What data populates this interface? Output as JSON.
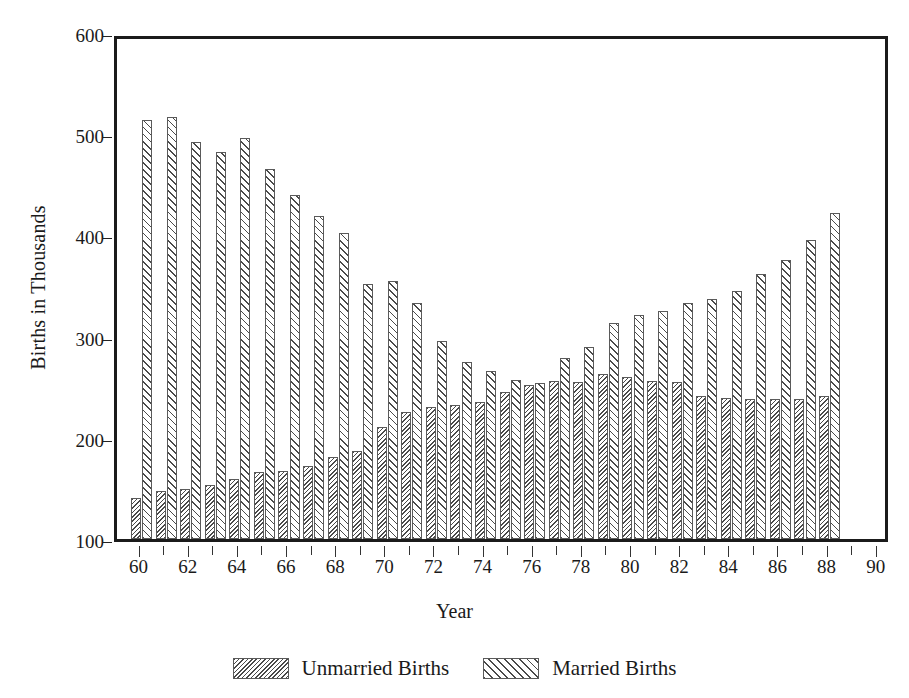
{
  "chart_data": {
    "type": "bar",
    "title": "",
    "xlabel": "Year",
    "ylabel": "Births in Thousands",
    "xlim": [
      59,
      90.5
    ],
    "ylim": [
      100,
      600
    ],
    "ybaseline": 100,
    "yticks": [
      600,
      500,
      400,
      300,
      200,
      100
    ],
    "ytick_labels": [
      "600",
      "500",
      "400",
      "300",
      "200",
      "100"
    ],
    "xticks_major": [
      60,
      62,
      64,
      66,
      68,
      70,
      72,
      74,
      76,
      78,
      80,
      82,
      84,
      86,
      88,
      90
    ],
    "xtick_labels": [
      "60",
      "62",
      "64",
      "66",
      "68",
      "70",
      "72",
      "74",
      "76",
      "78",
      "80",
      "82",
      "84",
      "86",
      "88",
      "90"
    ],
    "xticks_minor": [
      61,
      63,
      65,
      67,
      69,
      71,
      73,
      75,
      77,
      79,
      81,
      83,
      85,
      87,
      89
    ],
    "grid": false,
    "legend_position": "bottom",
    "categories": [
      60,
      61,
      62,
      63,
      64,
      65,
      66,
      67,
      68,
      69,
      70,
      71,
      72,
      73,
      74,
      75,
      76,
      77,
      78,
      79,
      80,
      81,
      82,
      83,
      84,
      85,
      86,
      87,
      88
    ],
    "series": [
      {
        "name": "Unmarried Births",
        "hatch": "dense-backslash",
        "values": [
          141,
          147,
          149,
          153,
          159,
          166,
          167,
          172,
          181,
          187,
          211,
          226,
          230,
          232,
          235,
          245,
          252,
          256,
          255,
          263,
          260,
          256,
          255,
          241,
          239,
          238,
          238,
          238,
          241
        ]
      },
      {
        "name": "Married Births",
        "hatch": "forwardslash",
        "values": [
          514,
          517,
          492,
          482,
          496,
          466,
          440,
          419,
          402,
          352,
          355,
          333,
          296,
          275,
          266,
          257,
          254,
          279,
          290,
          313,
          321,
          325,
          333,
          337,
          345,
          362,
          376,
          395,
          422
        ]
      }
    ]
  },
  "legend": {
    "items": [
      {
        "label": "Unmarried Births",
        "hatch": "unmarried"
      },
      {
        "label": "Married Births",
        "hatch": "married"
      }
    ]
  },
  "colors": {
    "frame": "#1b1b1b",
    "hatch": "#4a4a4a",
    "bar_edge": "#5a5a5a",
    "background": "#ffffff",
    "text": "#1a1a1a"
  }
}
